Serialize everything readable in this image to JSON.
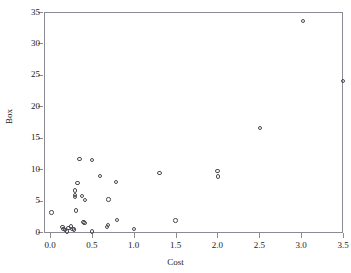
{
  "figure": {
    "top_clipped_text": "",
    "background": "#ffffff",
    "frame_color": "#8b8b93",
    "marker_color": "#4a4a52"
  },
  "chart_data": {
    "type": "scatter",
    "title": "",
    "xlabel": "Cost",
    "ylabel": "Box",
    "xlim": [
      0.0,
      3.5
    ],
    "ylim": [
      0,
      35
    ],
    "xticks": [
      0.0,
      0.5,
      1.0,
      1.5,
      2.0,
      2.5,
      3.0,
      3.5
    ],
    "xtick_labels": [
      "0.0",
      "0.5",
      "1.0",
      "1.5",
      "2.0",
      "2.5",
      "3.0",
      "3.5"
    ],
    "yticks": [
      0,
      5,
      10,
      15,
      20,
      25,
      30,
      35
    ],
    "ytick_labels": [
      "0",
      "5",
      "10",
      "15",
      "20",
      "25",
      "30",
      "35"
    ],
    "grid": false,
    "legend": false,
    "marker": "open-circle",
    "points": [
      {
        "x": 0.02,
        "y": 3.1
      },
      {
        "x": 0.15,
        "y": 0.8
      },
      {
        "x": 0.16,
        "y": 0.5
      },
      {
        "x": 0.18,
        "y": 0.3
      },
      {
        "x": 0.2,
        "y": 0.1
      },
      {
        "x": 0.22,
        "y": 0.6
      },
      {
        "x": 0.25,
        "y": 0.9
      },
      {
        "x": 0.27,
        "y": 0.5
      },
      {
        "x": 0.29,
        "y": 0.4
      },
      {
        "x": 0.3,
        "y": 5.6
      },
      {
        "x": 0.3,
        "y": 5.9
      },
      {
        "x": 0.3,
        "y": 6.6
      },
      {
        "x": 0.31,
        "y": 3.4
      },
      {
        "x": 0.33,
        "y": 7.8
      },
      {
        "x": 0.35,
        "y": 11.6
      },
      {
        "x": 0.38,
        "y": 5.7
      },
      {
        "x": 0.4,
        "y": 1.6
      },
      {
        "x": 0.41,
        "y": 1.4
      },
      {
        "x": 0.42,
        "y": 5.1
      },
      {
        "x": 0.5,
        "y": 11.5
      },
      {
        "x": 0.5,
        "y": 0.1
      },
      {
        "x": 0.6,
        "y": 8.9
      },
      {
        "x": 0.68,
        "y": 0.8
      },
      {
        "x": 0.69,
        "y": 1.1
      },
      {
        "x": 0.7,
        "y": 5.2
      },
      {
        "x": 0.79,
        "y": 8.0
      },
      {
        "x": 0.8,
        "y": 1.9
      },
      {
        "x": 1.0,
        "y": 0.5
      },
      {
        "x": 1.31,
        "y": 9.4
      },
      {
        "x": 1.5,
        "y": 1.8
      },
      {
        "x": 2.0,
        "y": 9.7
      },
      {
        "x": 2.01,
        "y": 8.8
      },
      {
        "x": 2.51,
        "y": 16.5
      },
      {
        "x": 3.02,
        "y": 33.6
      },
      {
        "x": 3.5,
        "y": 24.0
      }
    ]
  }
}
